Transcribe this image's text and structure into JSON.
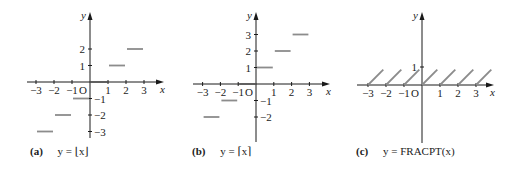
{
  "colors": {
    "axis": "#1a1a1a",
    "step": "#8c8c8c",
    "text": "#222222"
  },
  "chart_data": [
    {
      "id": "a",
      "type": "line",
      "title": "y = ⌊x⌋",
      "caption_tag": "(a)",
      "caption_eq": "y = ⌊x⌋",
      "xlabel": "x",
      "ylabel": "y",
      "origin_label": "O",
      "x_ticks": [
        -3,
        -2,
        -1,
        1,
        2,
        3
      ],
      "y_ticks": [
        -3,
        -2,
        -1,
        1,
        2
      ],
      "xlim": [
        -3.2,
        3.8
      ],
      "ylim": [
        -3.3,
        4.2
      ],
      "segments": [
        {
          "x0": -3,
          "x1": -2,
          "y": -3
        },
        {
          "x0": -2,
          "x1": -1,
          "y": -2
        },
        {
          "x0": -1,
          "x1": 0,
          "y": -1
        },
        {
          "x0": 0,
          "x1": 1,
          "y": 0
        },
        {
          "x0": 1,
          "x1": 2,
          "y": 1
        },
        {
          "x0": 2,
          "x1": 3,
          "y": 2
        }
      ],
      "layout": {
        "ox": 90,
        "oy": 82,
        "ux": 18,
        "uy": 16.5,
        "x_left": 27,
        "x_right": 164,
        "y_top": 12,
        "y_bottom": 138
      }
    },
    {
      "id": "b",
      "type": "line",
      "title": "y = ⌈x⌉",
      "caption_tag": "(b)",
      "caption_eq": "y = ⌈x⌉",
      "xlabel": "x",
      "ylabel": "y",
      "origin_label": "O",
      "x_ticks": [
        -3,
        -2,
        -1,
        1,
        2,
        3
      ],
      "y_ticks": [
        -2,
        -1,
        1,
        2,
        3
      ],
      "xlim": [
        -3.2,
        3.8
      ],
      "ylim": [
        -3.5,
        4.2
      ],
      "segments": [
        {
          "x0": -3,
          "x1": -2,
          "y": -2
        },
        {
          "x0": -2,
          "x1": -1,
          "y": -1
        },
        {
          "x0": -1,
          "x1": 0,
          "y": 0
        },
        {
          "x0": 0,
          "x1": 1,
          "y": 1
        },
        {
          "x0": 1,
          "x1": 2,
          "y": 2
        },
        {
          "x0": 2,
          "x1": 3,
          "y": 3
        }
      ],
      "layout": {
        "ox": 256,
        "oy": 84,
        "ux": 17.8,
        "uy": 16.5,
        "x_left": 193,
        "x_right": 330,
        "y_top": 12,
        "y_bottom": 142
      }
    },
    {
      "id": "c",
      "type": "line",
      "title": "y = FRACPT(x)",
      "caption_tag": "(c)",
      "caption_eq": "y = FRACPT(x)",
      "xlabel": "x",
      "ylabel": "y",
      "origin_label": "O",
      "x_ticks": [
        -3,
        -2,
        -1,
        1,
        2,
        3
      ],
      "y_ticks": [
        1
      ],
      "xlim": [
        -3.2,
        3.8
      ],
      "ylim": [
        -3.5,
        4.2
      ],
      "diagonals": [
        {
          "x0": -3,
          "x1": -2.15
        },
        {
          "x0": -2,
          "x1": -1.15
        },
        {
          "x0": -1,
          "x1": -0.15
        },
        {
          "x0": 0,
          "x1": 0.85
        },
        {
          "x0": 1,
          "x1": 1.85
        },
        {
          "x0": 2,
          "x1": 2.85
        },
        {
          "x0": 3,
          "x1": 3.85
        }
      ],
      "layout": {
        "ox": 422,
        "oy": 85,
        "ux": 18,
        "uy": 18,
        "x_left": 357,
        "x_right": 494,
        "y_top": 12,
        "y_bottom": 143
      }
    }
  ]
}
